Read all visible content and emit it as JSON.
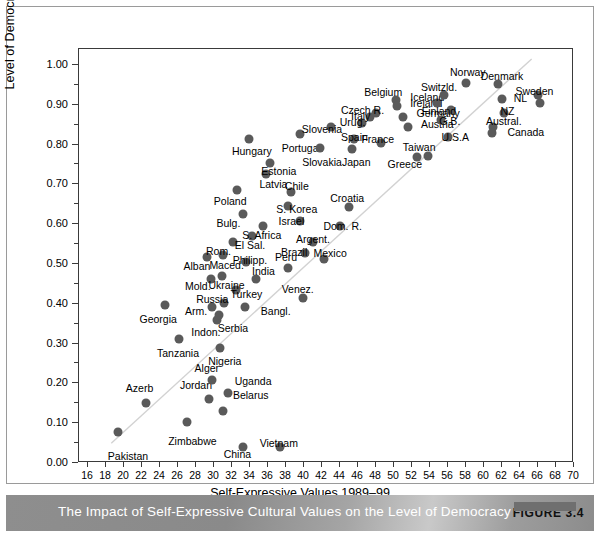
{
  "caption": {
    "text": "The Impact of Self-Expressive Cultural Values on the Level of Democracy",
    "figure_badge": "FIGURE 3.4"
  },
  "chart_data": {
    "type": "scatter",
    "title": "The Impact of Self-Expressive Cultural Values on the Level of Democracy",
    "xlabel": "Self-Expressive Values 1989–99",
    "ylabel": "Level of Democracy 2000–04",
    "xlim": [
      15,
      70
    ],
    "ylim": [
      0.0,
      1.04
    ],
    "xticks": [
      16,
      18,
      20,
      22,
      24,
      26,
      28,
      30,
      32,
      34,
      36,
      38,
      40,
      42,
      44,
      46,
      48,
      50,
      52,
      54,
      56,
      58,
      60,
      62,
      64,
      66,
      68,
      70
    ],
    "ytick_labels": [
      "0.00",
      "0.10",
      "0.20",
      "0.30",
      "0.40",
      "0.50",
      "0.60",
      "0.70",
      "0.80",
      "0.90",
      "1.00"
    ],
    "yticks": [
      0.0,
      0.1,
      0.2,
      0.3,
      0.4,
      0.5,
      0.6,
      0.7,
      0.8,
      0.9,
      1.0
    ],
    "ytick_minor": [
      0.05,
      0.15,
      0.25,
      0.35,
      0.45,
      0.55,
      0.65,
      0.75,
      0.85,
      0.95
    ],
    "grid": false,
    "legend": false,
    "trendline": {
      "x0": 18.6,
      "y0": 0.045,
      "x1": 65.5,
      "y1": 1.015
    },
    "marker_color": "#5a5a5a",
    "points": [
      {
        "label": "Pakistan",
        "x": 19.3,
        "y": 0.077,
        "lx": 18.2,
        "ly": 0.018,
        "anchor": "start"
      },
      {
        "label": "Azerb",
        "x": 22.4,
        "y": 0.151,
        "lx": 20.2,
        "ly": 0.188,
        "anchor": "start"
      },
      {
        "label": "Zimbabwe",
        "x": 27.0,
        "y": 0.103,
        "lx": 27.6,
        "ly": 0.056,
        "anchor": "middle"
      },
      {
        "label": "China",
        "x": 33.2,
        "y": 0.04,
        "lx": 32.6,
        "ly": 0.022,
        "anchor": "middle"
      },
      {
        "label": "Vietnam",
        "x": 37.3,
        "y": 0.04,
        "lx": 37.2,
        "ly": 0.05,
        "anchor": "middle"
      },
      {
        "label": "Belarus",
        "x": 31.0,
        "y": 0.131,
        "lx": 32.1,
        "ly": 0.172,
        "anchor": "start"
      },
      {
        "label": "Jordan",
        "x": 29.4,
        "y": 0.162,
        "lx": 28.0,
        "ly": 0.196,
        "anchor": "middle"
      },
      {
        "label": "Uganda",
        "x": 31.5,
        "y": 0.177,
        "lx": 32.3,
        "ly": 0.206,
        "anchor": "start"
      },
      {
        "label": "Alger",
        "x": 29.8,
        "y": 0.208,
        "lx": 29.2,
        "ly": 0.238,
        "anchor": "middle"
      },
      {
        "label": "Nigeria",
        "x": 30.7,
        "y": 0.29,
        "lx": 31.2,
        "ly": 0.256,
        "anchor": "middle"
      },
      {
        "label": "Tanzania",
        "x": 26.1,
        "y": 0.311,
        "lx": 26.0,
        "ly": 0.276,
        "anchor": "middle"
      },
      {
        "label": "Georgia",
        "x": 24.5,
        "y": 0.398,
        "lx": 23.8,
        "ly": 0.361,
        "anchor": "middle"
      },
      {
        "label": "Indon.",
        "x": 30.3,
        "y": 0.36,
        "lx": 29.1,
        "ly": 0.33,
        "anchor": "middle"
      },
      {
        "label": "Serbia",
        "x": 30.6,
        "y": 0.371,
        "lx": 32.1,
        "ly": 0.338,
        "anchor": "middle"
      },
      {
        "label": "Arm.",
        "x": 29.8,
        "y": 0.393,
        "lx": 28.0,
        "ly": 0.382,
        "anchor": "middle"
      },
      {
        "label": "Russia",
        "x": 31.1,
        "y": 0.402,
        "lx": 29.8,
        "ly": 0.412,
        "anchor": "middle"
      },
      {
        "label": "Bangl.",
        "x": 33.4,
        "y": 0.392,
        "lx": 35.2,
        "ly": 0.381,
        "anchor": "start"
      },
      {
        "label": "Turkey",
        "x": 32.4,
        "y": 0.435,
        "lx": 33.6,
        "ly": 0.424,
        "anchor": "middle"
      },
      {
        "label": "Venez.",
        "x": 39.9,
        "y": 0.414,
        "lx": 39.3,
        "ly": 0.437,
        "anchor": "middle"
      },
      {
        "label": "Mold.",
        "x": 29.7,
        "y": 0.461,
        "lx": 28.2,
        "ly": 0.444,
        "anchor": "middle"
      },
      {
        "label": "Ukraine",
        "x": 30.9,
        "y": 0.47,
        "lx": 31.4,
        "ly": 0.448,
        "anchor": "middle"
      },
      {
        "label": "India",
        "x": 34.7,
        "y": 0.462,
        "lx": 35.5,
        "ly": 0.482,
        "anchor": "middle"
      },
      {
        "label": "Alban",
        "x": 29.2,
        "y": 0.518,
        "lx": 28.1,
        "ly": 0.494,
        "anchor": "middle"
      },
      {
        "label": "Maced.",
        "x": 31.0,
        "y": 0.522,
        "lx": 31.4,
        "ly": 0.498,
        "anchor": "middle"
      },
      {
        "label": "Philipp.",
        "x": 33.6,
        "y": 0.505,
        "lx": 34.0,
        "ly": 0.509,
        "anchor": "middle"
      },
      {
        "label": "Peru",
        "x": 38.2,
        "y": 0.49,
        "lx": 38.0,
        "ly": 0.518,
        "anchor": "middle"
      },
      {
        "label": "Brazil",
        "x": 40.1,
        "y": 0.528,
        "lx": 38.9,
        "ly": 0.531,
        "anchor": "middle"
      },
      {
        "label": "Mexico",
        "x": 42.2,
        "y": 0.513,
        "lx": 42.9,
        "ly": 0.527,
        "anchor": "middle"
      },
      {
        "label": "Argent.",
        "x": 41.0,
        "y": 0.555,
        "lx": 41.0,
        "ly": 0.562,
        "anchor": "middle"
      },
      {
        "label": "Rom.",
        "x": 32.1,
        "y": 0.554,
        "lx": 30.5,
        "ly": 0.532,
        "anchor": "middle"
      },
      {
        "label": "El Sal.",
        "x": 34.2,
        "y": 0.57,
        "lx": 34.0,
        "ly": 0.548,
        "anchor": "middle"
      },
      {
        "label": "S. Africa",
        "x": 35.4,
        "y": 0.595,
        "lx": 35.3,
        "ly": 0.572,
        "anchor": "middle"
      },
      {
        "label": "Dom. R.",
        "x": 44.0,
        "y": 0.596,
        "lx": 44.3,
        "ly": 0.596,
        "anchor": "middle"
      },
      {
        "label": "Israel",
        "x": 39.5,
        "y": 0.607,
        "lx": 38.6,
        "ly": 0.607,
        "anchor": "middle"
      },
      {
        "label": "Bulg.",
        "x": 33.2,
        "y": 0.625,
        "lx": 31.6,
        "ly": 0.603,
        "anchor": "middle"
      },
      {
        "label": "S. Korea",
        "x": 38.2,
        "y": 0.646,
        "lx": 39.2,
        "ly": 0.638,
        "anchor": "middle"
      },
      {
        "label": "Croatia",
        "x": 45.0,
        "y": 0.644,
        "lx": 44.8,
        "ly": 0.665,
        "anchor": "middle"
      },
      {
        "label": "Poland",
        "x": 32.6,
        "y": 0.686,
        "lx": 31.8,
        "ly": 0.658,
        "anchor": "middle"
      },
      {
        "label": "Chile",
        "x": 38.6,
        "y": 0.682,
        "lx": 39.2,
        "ly": 0.695,
        "anchor": "middle"
      },
      {
        "label": "Latvia",
        "x": 35.8,
        "y": 0.726,
        "lx": 36.6,
        "ly": 0.702,
        "anchor": "middle"
      },
      {
        "label": "Estonia",
        "x": 36.2,
        "y": 0.753,
        "lx": 37.2,
        "ly": 0.734,
        "anchor": "middle"
      },
      {
        "label": "Hungary",
        "x": 33.9,
        "y": 0.815,
        "lx": 34.2,
        "ly": 0.784,
        "anchor": "middle"
      },
      {
        "label": "Portugal",
        "x": 39.6,
        "y": 0.827,
        "lx": 39.7,
        "ly": 0.792,
        "anchor": "middle"
      },
      {
        "label": "Slovakia",
        "x": 41.8,
        "y": 0.792,
        "lx": 42.0,
        "ly": 0.757,
        "anchor": "middle"
      },
      {
        "label": "Japan",
        "x": 45.3,
        "y": 0.79,
        "lx": 45.8,
        "ly": 0.757,
        "anchor": "middle"
      },
      {
        "label": "Slovenia",
        "x": 43.0,
        "y": 0.845,
        "lx": 42.0,
        "ly": 0.838,
        "anchor": "middle"
      },
      {
        "label": "Spain",
        "x": 45.6,
        "y": 0.813,
        "lx": 45.6,
        "ly": 0.818,
        "anchor": "middle"
      },
      {
        "label": "Urug.",
        "x": 46.4,
        "y": 0.855,
        "lx": 45.4,
        "ly": 0.856,
        "anchor": "middle"
      },
      {
        "label": "Italy",
        "x": 47.3,
        "y": 0.868,
        "lx": 46.3,
        "ly": 0.872,
        "anchor": "middle"
      },
      {
        "label": "Czech R.",
        "x": 48.0,
        "y": 0.88,
        "lx": 46.5,
        "ly": 0.888,
        "anchor": "middle"
      },
      {
        "label": "France",
        "x": 48.5,
        "y": 0.805,
        "lx": 48.2,
        "ly": 0.813,
        "anchor": "middle"
      },
      {
        "label": "Greece",
        "x": 52.5,
        "y": 0.768,
        "lx": 51.2,
        "ly": 0.75,
        "anchor": "middle"
      },
      {
        "label": "Taiwan",
        "x": 53.8,
        "y": 0.77,
        "lx": 52.8,
        "ly": 0.795,
        "anchor": "middle"
      },
      {
        "label": "Belgium",
        "x": 50.2,
        "y": 0.912,
        "lx": 48.8,
        "ly": 0.932,
        "anchor": "middle"
      },
      {
        "label": "Ireland",
        "x": 50.3,
        "y": 0.898,
        "lx": 51.8,
        "ly": 0.905,
        "anchor": "start"
      },
      {
        "label": "Germany",
        "x": 51.0,
        "y": 0.87,
        "lx": 52.5,
        "ly": 0.878,
        "anchor": "start"
      },
      {
        "label": "Austria",
        "x": 51.6,
        "y": 0.845,
        "lx": 53.0,
        "ly": 0.852,
        "anchor": "start"
      },
      {
        "label": "Iceland",
        "x": 54.8,
        "y": 0.905,
        "lx": 53.7,
        "ly": 0.92,
        "anchor": "middle"
      },
      {
        "label": "Switzld.",
        "x": 55.6,
        "y": 0.925,
        "lx": 55.0,
        "ly": 0.945,
        "anchor": "middle"
      },
      {
        "label": "Finland",
        "x": 56.3,
        "y": 0.888,
        "lx": 55.0,
        "ly": 0.885,
        "anchor": "middle"
      },
      {
        "label": "Norway",
        "x": 58.0,
        "y": 0.955,
        "lx": 58.2,
        "ly": 0.982,
        "anchor": "middle"
      },
      {
        "label": "G.B.",
        "x": 55.2,
        "y": 0.862,
        "lx": 56.2,
        "ly": 0.858,
        "anchor": "middle"
      },
      {
        "label": "U.S.A",
        "x": 56.0,
        "y": 0.82,
        "lx": 56.8,
        "ly": 0.818,
        "anchor": "middle"
      },
      {
        "label": "Denmark",
        "x": 61.5,
        "y": 0.952,
        "lx": 62.0,
        "ly": 0.972,
        "anchor": "middle"
      },
      {
        "label": "NL",
        "x": 62.0,
        "y": 0.915,
        "lx": 63.3,
        "ly": 0.918,
        "anchor": "start"
      },
      {
        "label": "NZ",
        "x": 62.2,
        "y": 0.878,
        "lx": 62.6,
        "ly": 0.884,
        "anchor": "middle"
      },
      {
        "label": "Austral.",
        "x": 61.0,
        "y": 0.845,
        "lx": 62.2,
        "ly": 0.858,
        "anchor": "middle"
      },
      {
        "label": "Canada",
        "x": 60.9,
        "y": 0.828,
        "lx": 62.6,
        "ly": 0.832,
        "anchor": "start"
      },
      {
        "label": "Sweden",
        "x": 66.0,
        "y": 0.925,
        "lx": 65.6,
        "ly": 0.935,
        "anchor": "middle"
      },
      {
        "label": "Sweden2",
        "x": 66.2,
        "y": 0.905,
        "lx": null,
        "ly": null,
        "anchor": "middle"
      }
    ]
  }
}
